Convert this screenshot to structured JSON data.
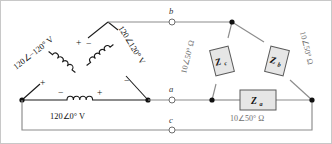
{
  "diagram": {
    "colors": {
      "wire": "#8c8c8c",
      "component": "#1a1a1a",
      "impedance_fill": "#e6e6e6",
      "impedance_stroke": "#5a5a5a",
      "value_text": "#6f6f6f"
    },
    "sources": [
      {
        "id": "source-ca",
        "label": "120∠−120° V",
        "position": "upper-left",
        "polarity_near": "−",
        "polarity_far": "+",
        "symbol": "inductor-coil"
      },
      {
        "id": "source-bc",
        "label": "120∠120° V",
        "position": "upper-right",
        "polarity_near": "+",
        "polarity_far": "−",
        "symbol": "inductor-coil"
      },
      {
        "id": "source-ab",
        "label": "120∠0° V",
        "position": "bottom",
        "polarity_left": "−",
        "polarity_right": "+",
        "symbol": "inductor-coil"
      }
    ],
    "impedances": [
      {
        "id": "impedance-zc",
        "symbol": "Z",
        "subscript": "c",
        "value": "10∠50° Ω",
        "position": "upper-left-branch"
      },
      {
        "id": "impedance-zb",
        "symbol": "Z",
        "subscript": "b",
        "value": "10∠50° Ω",
        "position": "upper-right-branch"
      },
      {
        "id": "impedance-za",
        "symbol": "Z",
        "subscript": "a",
        "value": "10∠50° Ω",
        "position": "bottom-branch"
      }
    ],
    "terminals": [
      {
        "id": "terminal-b",
        "label": "b",
        "line": "top"
      },
      {
        "id": "terminal-a",
        "label": "a",
        "line": "middle"
      },
      {
        "id": "terminal-c",
        "label": "c",
        "line": "bottom"
      }
    ]
  }
}
